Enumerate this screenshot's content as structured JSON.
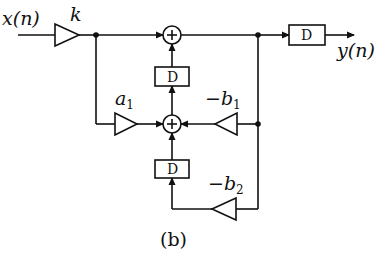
{
  "diagram": {
    "caption": "(b)",
    "input_label": "x(n)",
    "output_label": "y(n)",
    "gain_k": "k",
    "gain_a1": {
      "base": "a",
      "sub": "1"
    },
    "gain_b1": {
      "base": "−b",
      "sub": "1"
    },
    "gain_b2": {
      "base": "−b",
      "sub": "2"
    },
    "delay_label": "D",
    "adder_symbol": "+",
    "blocks": [
      {
        "id": "k",
        "type": "gain"
      },
      {
        "id": "a1",
        "type": "gain"
      },
      {
        "id": "-b1",
        "type": "gain"
      },
      {
        "id": "-b2",
        "type": "gain"
      },
      {
        "id": "D_top",
        "type": "delay"
      },
      {
        "id": "D_bottom",
        "type": "delay"
      },
      {
        "id": "D_out",
        "type": "delay"
      },
      {
        "id": "sum_top",
        "type": "adder"
      },
      {
        "id": "sum_mid",
        "type": "adder"
      }
    ]
  }
}
